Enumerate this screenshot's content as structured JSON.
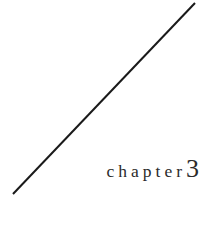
{
  "page": {
    "name": "chapter-divider-page",
    "background_color": "#ffffff",
    "width": 201,
    "height": 238
  },
  "heading": {
    "word": "chapter",
    "number": "3",
    "text_color": "#2b2b2b"
  },
  "decoration": {
    "rule_name": "diagonal-rule",
    "rule_color": "#1a1a1a",
    "rule_thickness": 2,
    "x1": 13,
    "y1": 194,
    "x2": 195,
    "y2": 3
  }
}
